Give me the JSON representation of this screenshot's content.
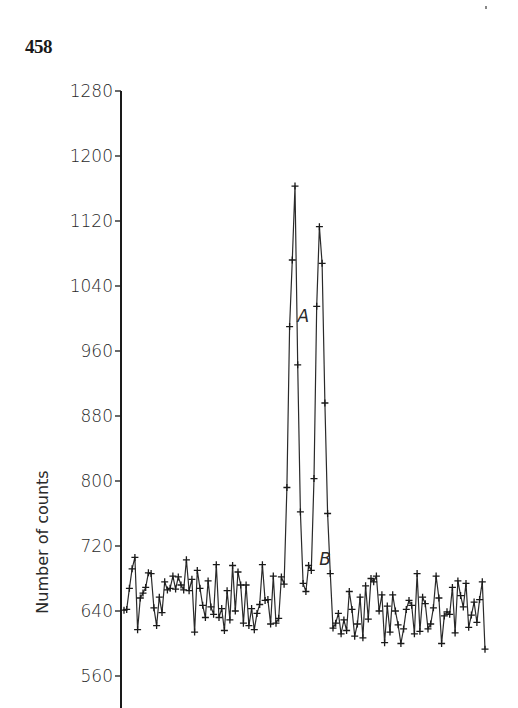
{
  "page": {
    "number": "458"
  },
  "chart_data": {
    "type": "line",
    "title": "",
    "xlabel": "",
    "ylabel": "Number of counts",
    "ylim": [
      548,
      1280
    ],
    "y_ticks": [
      560,
      640,
      720,
      800,
      880,
      960,
      1040,
      1120,
      1200,
      1280
    ],
    "y_tick_labels": [
      "560",
      "640",
      "720",
      "800",
      "880",
      "960",
      "1040",
      "1120",
      "1200",
      "1280"
    ],
    "grid": false,
    "legend": null,
    "marker": "+",
    "annotations": [
      {
        "label": "A",
        "index": 61,
        "value": 1163
      },
      {
        "label": "B",
        "index": 69,
        "value": 1113
      }
    ],
    "series": [
      {
        "name": "counts",
        "values": [
          641,
          642,
          668,
          692,
          706,
          617,
          656,
          662,
          669,
          687,
          686,
          644,
          622,
          657,
          638,
          676,
          666,
          668,
          683,
          667,
          682,
          672,
          666,
          703,
          665,
          679,
          614,
          690,
          668,
          647,
          632,
          677,
          645,
          636,
          697,
          632,
          643,
          616,
          665,
          629,
          696,
          640,
          688,
          672,
          625,
          672,
          622,
          643,
          617,
          637,
          648,
          697,
          653,
          654,
          624,
          683,
          625,
          631,
          682,
          673,
          792,
          990,
          1072,
          1163,
          943,
          762,
          674,
          664,
          696,
          690,
          803,
          1015,
          1113,
          1068,
          896,
          760,
          686,
          619,
          625,
          637,
          612,
          629,
          616,
          664,
          642,
          609,
          624,
          657,
          607,
          671,
          630,
          680,
          676,
          683,
          640,
          660,
          601,
          646,
          614,
          660,
          640,
          623,
          600,
          618,
          642,
          653,
          647,
          612,
          686,
          615,
          657,
          649,
          618,
          624,
          644,
          683,
          656,
          600,
          634,
          639,
          636,
          669,
          613,
          677,
          659,
          645,
          674,
          620,
          635,
          651,
          626,
          654,
          676,
          593
        ]
      }
    ]
  }
}
